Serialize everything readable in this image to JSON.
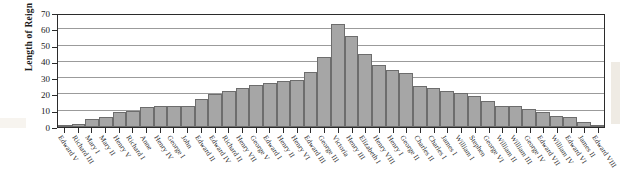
{
  "chart_data": {
    "type": "bar",
    "title": "",
    "xlabel": "",
    "ylabel": "Length of Reign",
    "ylim": [
      0,
      70
    ],
    "ytick_values": [
      0,
      10,
      20,
      30,
      40,
      50,
      60,
      70
    ],
    "ytick_labels": [
      "0",
      "10",
      "20",
      "30",
      "40",
      "50",
      "60",
      "70"
    ],
    "grid": true,
    "legend": "none",
    "bar_color": "#a6a6a6",
    "bar_edge_color": "#6d6d6d",
    "categories": [
      "Edward V",
      "Richard III",
      "Mary I",
      "Mary II",
      "Henry V",
      "Richard I",
      "Anne",
      "Henry IV",
      "George I",
      "John",
      "Edward II",
      "Edward IV",
      "Richard II",
      "Henry VII",
      "George V",
      "Edward I",
      "Henry II",
      "Henry VI",
      "Edward III",
      "George III",
      "Victoria",
      "Henry III",
      "Elizabeth I",
      "Henry VIII",
      "Henry I",
      "George II",
      "Charles II",
      "Charles I",
      "James I",
      "William I",
      "Stephen",
      "George VI",
      "William II",
      "William III",
      "George IV",
      "Edward VII",
      "William IV",
      "Edward VI",
      "James II",
      "Edward VIII"
    ],
    "values": [
      0,
      2,
      5,
      6,
      9,
      10,
      12,
      13,
      13,
      13,
      17,
      20,
      22,
      24,
      26,
      27,
      28,
      29,
      34,
      43,
      63,
      56,
      45,
      38,
      35,
      33,
      25,
      24,
      22,
      21,
      19,
      16,
      13,
      13,
      11,
      9,
      7,
      6,
      3,
      1
    ]
  },
  "axis": {
    "y_title": "Length of Reign"
  }
}
